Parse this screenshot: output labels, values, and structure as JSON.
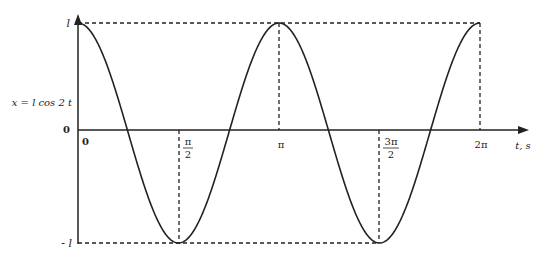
{
  "chart_data": {
    "type": "line",
    "title": "",
    "function_label": "x = l cos 2 t",
    "xlabel": "t, s",
    "ylabel": "x = l cos 2 t",
    "x_ticks": [
      {
        "value": 0,
        "label": "0"
      },
      {
        "value": 1.5708,
        "label": "π/2",
        "num": "π",
        "den": "2"
      },
      {
        "value": 3.1416,
        "label": "π"
      },
      {
        "value": 4.7124,
        "label": "3π/2",
        "num": "3π",
        "den": "2"
      },
      {
        "value": 6.2832,
        "label": "2π"
      }
    ],
    "y_ticks": [
      {
        "value": 1,
        "label": "l"
      },
      {
        "value": 0,
        "label": "0"
      },
      {
        "value": -1,
        "label": "- l"
      }
    ],
    "xlim": [
      0,
      6.2832
    ],
    "ylim": [
      -1,
      1
    ],
    "grid": false,
    "legend": null,
    "series": [
      {
        "name": "x = l cos 2t",
        "x": [
          0,
          0.7854,
          1.5708,
          2.3562,
          3.1416,
          3.927,
          4.7124,
          5.4978,
          6.2832
        ],
        "y": [
          1,
          0,
          -1,
          0,
          1,
          0,
          -1,
          0,
          1
        ]
      }
    ],
    "annotations": [
      "dashed horizontal line at x = l",
      "dashed horizontal line at x = -l",
      "dashed vertical lines at t = π/2, π, 3π/2, 2π"
    ]
  },
  "labels": {
    "y_top": "l",
    "y_zero": "0",
    "y_bottom": "- l",
    "origin": "0",
    "ylabel": "x = l cos 2 t",
    "xlabel": "t, s",
    "pi_half_num": "π",
    "pi_half_den": "2",
    "pi": "π",
    "three_pi_half_num": "3π",
    "three_pi_half_den": "2",
    "two_pi": "2π"
  }
}
